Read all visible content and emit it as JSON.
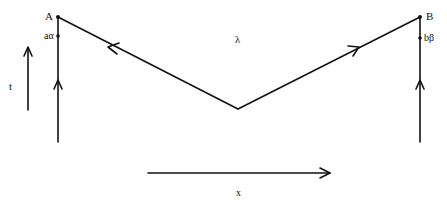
{
  "diagram": {
    "type": "spacetime-diagram",
    "points": {
      "A": {
        "label": "A",
        "x": 58,
        "y": 17
      },
      "B": {
        "label": "B",
        "x": 420,
        "y": 17
      },
      "a_alpha": {
        "label": "aα",
        "x": 58,
        "y": 36
      },
      "b_beta": {
        "label": "bβ",
        "x": 420,
        "y": 38
      },
      "vertex": {
        "x": 238,
        "y": 109
      }
    },
    "labels": {
      "lambda": "λ",
      "time_axis": "t",
      "space_axis": "x"
    },
    "axes": {
      "time": {
        "label": "t",
        "direction": "up"
      },
      "space": {
        "label": "x",
        "direction": "right"
      }
    },
    "lines": [
      {
        "name": "worldline-a",
        "from": "bottom",
        "to": "A",
        "arrow": "up"
      },
      {
        "name": "worldline-b",
        "from": "bottom",
        "to": "B",
        "arrow": "up"
      },
      {
        "name": "lambda-left-branch",
        "from": "vertex",
        "to": "A",
        "arrow": "toward A"
      },
      {
        "name": "lambda-right-branch",
        "from": "vertex",
        "to": "B",
        "arrow": "toward B"
      }
    ],
    "stroke_color": "#111111",
    "background_color": "#ffffff"
  }
}
